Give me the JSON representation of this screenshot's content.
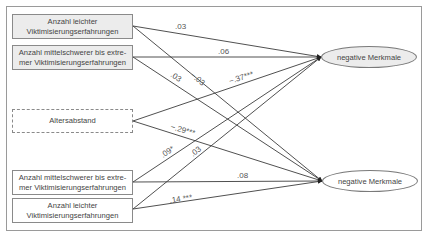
{
  "diagram": {
    "type": "path-model",
    "predictors": [
      {
        "id": "p1",
        "label": "Anzahl  leichter Viktimisierungserfahrungen",
        "style": "shaded"
      },
      {
        "id": "p2",
        "label": "Anzahl mittelschwerer bis extre-mer Viktimisierungserfahrungen",
        "style": "shaded"
      },
      {
        "id": "p3",
        "label": "Altersabstand",
        "style": "dashed"
      },
      {
        "id": "p4",
        "label": "Anzahl mittelschwerer bis extre-mer Viktimisierungserfahrungen",
        "style": "plain"
      },
      {
        "id": "p5",
        "label": "Anzahl leichter Viktimisierungserfahrungen",
        "style": "plain"
      }
    ],
    "outcomes": [
      {
        "id": "o1",
        "label": "negative Merkmale",
        "fill": "#ececec"
      },
      {
        "id": "o2",
        "label": "negative Merkmale",
        "fill": "#ffffff"
      }
    ],
    "paths": [
      {
        "from": "p1",
        "to": "o1",
        "coef": ".03"
      },
      {
        "from": "p1",
        "to": "o2",
        "coef": "−.03"
      },
      {
        "from": "p2",
        "to": "o1",
        "coef": ".06"
      },
      {
        "from": "p2",
        "to": "o2",
        "coef": ".03"
      },
      {
        "from": "p3",
        "to": "o1",
        "coef": "−.37***"
      },
      {
        "from": "p3",
        "to": "o2",
        "coef": "−.29***"
      },
      {
        "from": "p4",
        "to": "o1",
        "coef": ".09*"
      },
      {
        "from": "p4",
        "to": "o2",
        "coef": ".08"
      },
      {
        "from": "p5",
        "to": "o1",
        "coef": ".03"
      },
      {
        "from": "p5",
        "to": "o2",
        "coef": ".14 ***"
      }
    ]
  },
  "colors": {
    "frame": "#9a9a9a",
    "line": "#3c3c3c",
    "shaded_fill": "#ececec"
  }
}
